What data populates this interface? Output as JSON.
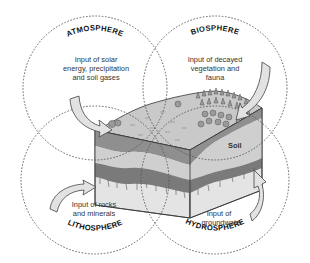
{
  "diagram": {
    "spheres": [
      {
        "id": "atmosphere",
        "name": "ATMOSPHERE",
        "caption": [
          "Input of solar",
          "energy, precipitation",
          "and soil gases"
        ]
      },
      {
        "id": "biosphere",
        "name": "BIOSPHERE",
        "caption": [
          "Input of decayed",
          "vegetation and",
          "fauna"
        ]
      },
      {
        "id": "lithosphere",
        "name": "LITHOSPHERE",
        "caption": [
          "Input of rocks",
          "and minerals"
        ]
      },
      {
        "id": "hydrosphere",
        "name": "HYDROSPHERE",
        "caption": [
          "Input of",
          "groundwater"
        ]
      }
    ],
    "center_block": {
      "label": "Soil"
    },
    "colors": {
      "circle_stroke": "#555555",
      "arrow_fill": "#e2e2e2",
      "top_surface": "#c9c9c9",
      "soil_band": "#8f8f8f",
      "light_band": "#cfcfcf",
      "dark_band": "#7a7a7a",
      "bedrock": "#e4e4e4",
      "trees": "#9a9a9a"
    }
  }
}
